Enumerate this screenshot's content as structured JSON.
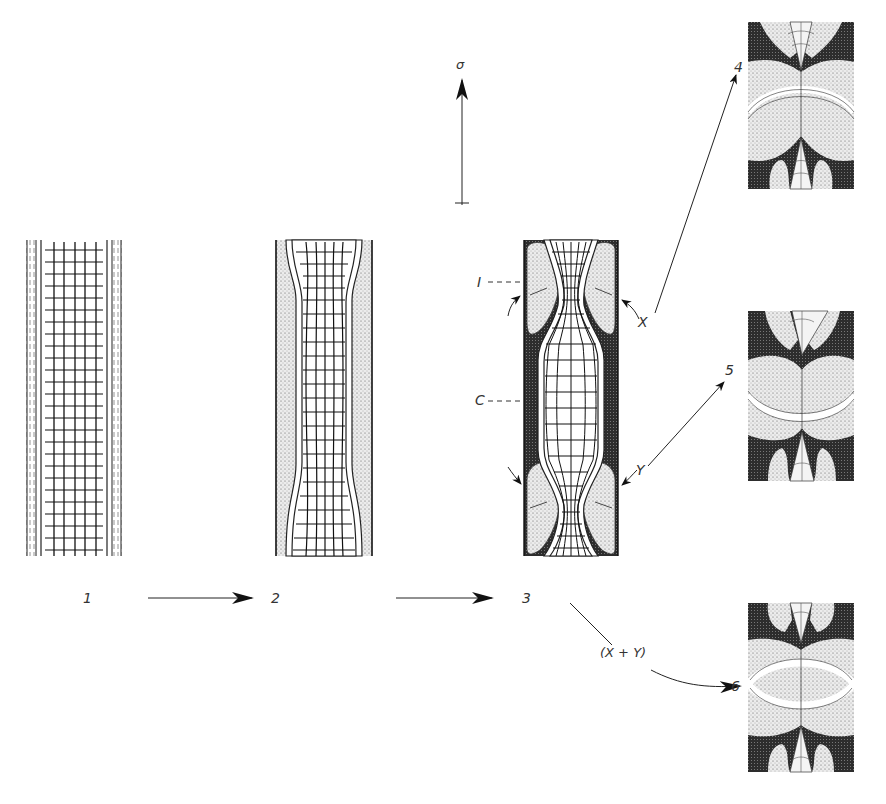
{
  "diagram": {
    "type": "sequence-of-stages",
    "colors": {
      "ink": "#1a1a1a",
      "stipple": "#d9d9d9",
      "dark_fill": "#3a3a3a",
      "background": "#ffffff"
    },
    "stress_arrow": {
      "label": "σ",
      "direction": "up"
    },
    "stages": [
      {
        "id": "1",
        "label": "1"
      },
      {
        "id": "2",
        "label": "2"
      },
      {
        "id": "3",
        "label": "3"
      }
    ],
    "stage3_annotations": {
      "I": "I",
      "C": "C",
      "X": "X",
      "Y": "Y"
    },
    "details": [
      {
        "id": "4",
        "label": "4",
        "source": "X"
      },
      {
        "id": "5",
        "label": "5",
        "source": "Y"
      },
      {
        "id": "6",
        "label": "6",
        "source": "(X+Y)"
      }
    ],
    "combined_label": "(X + Y)"
  }
}
